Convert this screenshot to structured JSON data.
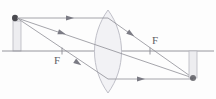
{
  "figure": {
    "type": "optics-ray-diagram",
    "canvas": {
      "width": 216,
      "height": 99,
      "background": "#fdfdfd"
    }
  },
  "labels": {
    "focal_left": "F",
    "focal_right": "F"
  },
  "colors": {
    "ray": "#8e8e96",
    "axis": "#8a8a92",
    "lens_outline": "#b9b9c2",
    "lens_fill": "#f2f2f5",
    "object_fill": "#ededf0",
    "object_outline": "#b6b6bd",
    "object_tip": "#4a4a50",
    "image_fill": "#ededf0",
    "image_outline": "#b6b6bd",
    "arrowhead": "#7b7b84",
    "label_text": "#5d5d64"
  },
  "optics": {
    "principal_axis_y": 51,
    "lens_center_x": 108,
    "lens_top_y": 10,
    "lens_bottom_y": 93,
    "lens_half_width": 9,
    "focal_left_x": 62,
    "focal_right_x": 150,
    "object": {
      "base_x": 17,
      "base_y": 51,
      "tip_y": 18,
      "half_width": 4,
      "orientation": "upright",
      "description": "object standing on the principal axis left of the lens"
    },
    "image": {
      "base_x": 193,
      "base_y": 51,
      "tip_y": 78,
      "half_width": 4,
      "orientation": "inverted",
      "description": "real inverted image formed right of the lens beyond the focal point"
    },
    "rays": [
      {
        "id": "parallel-ray",
        "description": "Ray from object tip travelling parallel to the principal axis, refracted through the far focal point F",
        "points": [
          [
            17,
            18
          ],
          [
            108,
            18
          ],
          [
            193,
            78
          ]
        ],
        "arrowheads": [
          {
            "x": 70,
            "y": 18,
            "angle": 0
          },
          {
            "x": 131,
            "y": 34,
            "angle": 35
          }
        ]
      },
      {
        "id": "central-ray",
        "description": "Ray from object tip through the optical centre of the lens, undeviated",
        "points": [
          [
            17,
            18
          ],
          [
            193,
            78
          ]
        ],
        "arrowheads": [
          {
            "x": 62,
            "y": 33,
            "angle": 18
          }
        ]
      },
      {
        "id": "focal-ray",
        "description": "Ray from object tip through the near focal point F, emerging parallel to the principal axis",
        "points": [
          [
            17,
            18
          ],
          [
            108,
            79
          ],
          [
            193,
            79
          ]
        ],
        "arrowheads": [
          {
            "x": 78,
            "y": 63,
            "angle": 34
          },
          {
            "x": 141,
            "y": 79,
            "angle": 0
          }
        ]
      }
    ],
    "focal_ticks": [
      {
        "x": 62,
        "y": 51
      },
      {
        "x": 150,
        "y": 51
      }
    ]
  }
}
